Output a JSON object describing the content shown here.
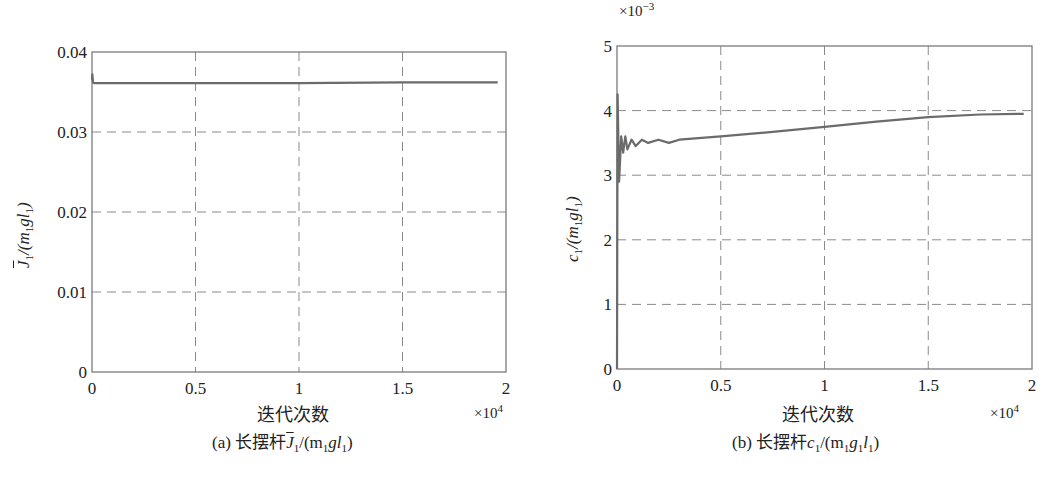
{
  "chart_data": [
    {
      "type": "line",
      "title": "",
      "caption": "(a) 长摆杆J̄1/(m1gl1)",
      "caption_prefix": "(a) 长摆杆",
      "xlabel": "迭代次数",
      "x_multiplier": "×10^4",
      "ylabel": "J̄1/(m1gl1)",
      "xlim": [
        0,
        2
      ],
      "ylim": [
        0,
        0.04
      ],
      "xticks": [
        "0",
        "0.5",
        "1",
        "1.5",
        "2"
      ],
      "yticks": [
        "0",
        "0.01",
        "0.02",
        "0.03",
        "0.04"
      ],
      "grid": true,
      "grid_style": "dashed",
      "series": [
        {
          "name": "J̄1/(m1gl1)",
          "x": [
            0,
            0.002,
            0.005,
            0.01,
            0.02,
            0.5,
            1.0,
            1.5,
            1.96
          ],
          "y": [
            0.0365,
            0.0372,
            0.0362,
            0.0361,
            0.0361,
            0.0361,
            0.0361,
            0.0362,
            0.0362
          ]
        }
      ]
    },
    {
      "type": "line",
      "title": "",
      "caption": "(b) 长摆杆c1/(m1g1l1)",
      "caption_prefix": "(b) 长摆杆",
      "xlabel": "迭代次数",
      "x_multiplier": "×10^4",
      "y_multiplier": "×10^-3",
      "ylabel": "c1/(m1gl1)",
      "xlim": [
        0,
        2
      ],
      "ylim": [
        0,
        5
      ],
      "xticks": [
        "0",
        "0.5",
        "1",
        "1.5",
        "2"
      ],
      "yticks": [
        "0",
        "1",
        "2",
        "3",
        "4",
        "5"
      ],
      "grid": true,
      "grid_style": "dashed",
      "series": [
        {
          "name": "c1/(m1gl1)",
          "x": [
            0,
            0.003,
            0.01,
            0.02,
            0.03,
            0.04,
            0.05,
            0.07,
            0.09,
            0.12,
            0.15,
            0.2,
            0.25,
            0.3,
            0.5,
            0.75,
            1.0,
            1.25,
            1.5,
            1.75,
            1.96
          ],
          "y": [
            0.0,
            4.25,
            2.9,
            3.6,
            3.35,
            3.6,
            3.4,
            3.55,
            3.45,
            3.55,
            3.5,
            3.55,
            3.5,
            3.55,
            3.6,
            3.67,
            3.75,
            3.83,
            3.9,
            3.94,
            3.95
          ]
        }
      ]
    }
  ],
  "panels": {
    "a": {
      "yticks": [
        "0.04",
        "0.03",
        "0.02",
        "0.01",
        "0"
      ],
      "xticks": [
        "0",
        "0.5",
        "1",
        "1.5",
        "2"
      ],
      "xlabel": "迭代次数",
      "mult_base": "×10",
      "mult_exp": "4",
      "ylabel_J": "J",
      "ylabel_sub1": "1",
      "ylabel_rest": "/(m",
      "ylabel_sub2": "1",
      "ylabel_g": "gl",
      "ylabel_sub3": "1",
      "ylabel_close": ")",
      "caption_prefix": "(a) 长摆杆",
      "caption_J": "J",
      "caption_sub1": "1",
      "caption_mid": "/(m",
      "caption_sub2": "1",
      "caption_gl": "gl",
      "caption_sub3": "1",
      "caption_close": ")"
    },
    "b": {
      "yticks": [
        "5",
        "4",
        "3",
        "2",
        "1",
        "0"
      ],
      "xticks": [
        "0",
        "0.5",
        "1",
        "1.5",
        "2"
      ],
      "xlabel": "迭代次数",
      "mult_base": "×10",
      "mult_exp": "4",
      "ymult_base": "×10",
      "ymult_exp": "−3",
      "ylabel_c": "c",
      "ylabel_sub1": "1",
      "ylabel_rest": "/(m",
      "ylabel_sub2": "1",
      "ylabel_g": "gl",
      "ylabel_sub3": "1",
      "ylabel_close": ")",
      "caption_prefix": "(b) 长摆杆",
      "caption_c": "c",
      "caption_sub1": "1",
      "caption_mid": "/(m",
      "caption_sub2": "1",
      "caption_g": "g",
      "caption_sub3": "1",
      "caption_l": "l",
      "caption_sub4": "1",
      "caption_close": ")"
    }
  },
  "colors": {
    "line": "#6b6b6b",
    "grid": "#8a8a8a",
    "axis": "#7a7a7a",
    "text": "#222222"
  }
}
